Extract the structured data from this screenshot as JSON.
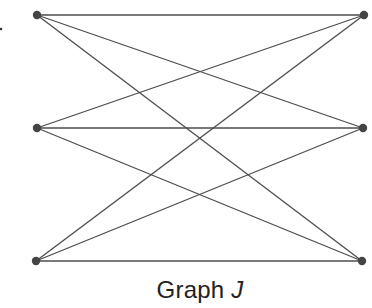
{
  "diagram": {
    "type": "graph",
    "title": "Graph",
    "title_variable": "J",
    "colors": {
      "edge": "#4d4d4d",
      "node": "#444444",
      "text": "#222222",
      "background": "#ffffff"
    },
    "nodes": [
      {
        "id": "L1",
        "x": 37,
        "y": 15
      },
      {
        "id": "L2",
        "x": 37,
        "y": 128
      },
      {
        "id": "L3",
        "x": 36,
        "y": 261
      },
      {
        "id": "R1",
        "x": 364,
        "y": 15
      },
      {
        "id": "R2",
        "x": 363,
        "y": 128
      },
      {
        "id": "R3",
        "x": 362,
        "y": 261
      }
    ],
    "edges": [
      [
        "L1",
        "R1"
      ],
      [
        "L1",
        "R2"
      ],
      [
        "L1",
        "R3"
      ],
      [
        "L2",
        "R1"
      ],
      [
        "L2",
        "R2"
      ],
      [
        "L2",
        "R3"
      ],
      [
        "L3",
        "R1"
      ],
      [
        "L3",
        "R2"
      ],
      [
        "L3",
        "R3"
      ]
    ],
    "stray_mark": {
      "x": 1,
      "y": 29
    }
  }
}
